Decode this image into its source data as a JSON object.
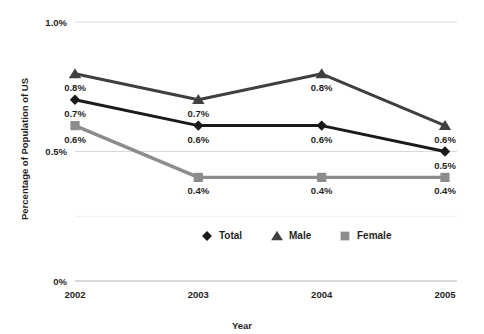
{
  "chart_data": {
    "type": "line",
    "title": "",
    "xlabel": "Year",
    "ylabel": "Percentage of Population of US",
    "categories": [
      "2002",
      "2003",
      "2004",
      "2005"
    ],
    "x_tick_labels": [
      "2002",
      "2003",
      "2004",
      "2005"
    ],
    "y_tick_labels": [
      "1.0%",
      "0.5%",
      "0%"
    ],
    "y_tick_values": [
      1.0,
      0.5,
      0.0
    ],
    "ylim": [
      0,
      1.0
    ],
    "grid": "horizontal-only",
    "legend_position": "bottom-center",
    "series": [
      {
        "name": "Total",
        "marker": "diamond",
        "color": "#1a1a1a",
        "values": [
          0.7,
          0.6,
          0.6,
          0.5
        ],
        "point_labels": [
          "0.7%",
          "0.6%",
          "0.6%",
          "0.5%"
        ]
      },
      {
        "name": "Male",
        "marker": "triangle",
        "color": "#404040",
        "values": [
          0.8,
          0.7,
          0.8,
          0.6
        ],
        "point_labels": [
          "0.8%",
          "0.7%",
          "0.8%",
          "0.6%"
        ]
      },
      {
        "name": "Female",
        "marker": "square",
        "color": "#8c8c8c",
        "values": [
          0.6,
          0.4,
          0.4,
          0.4
        ],
        "point_labels": [
          "0.6%",
          "0.4%",
          "0.4%",
          "0.4%"
        ]
      }
    ]
  },
  "legend": {
    "items": [
      {
        "label": "Total",
        "marker": "diamond",
        "color": "#1a1a1a"
      },
      {
        "label": "Male",
        "marker": "triangle",
        "color": "#404040"
      },
      {
        "label": "Female",
        "marker": "square",
        "color": "#8c8c8c"
      }
    ]
  },
  "axes": {
    "y_title": "Percentage of Population of US",
    "x_title": "Year"
  }
}
